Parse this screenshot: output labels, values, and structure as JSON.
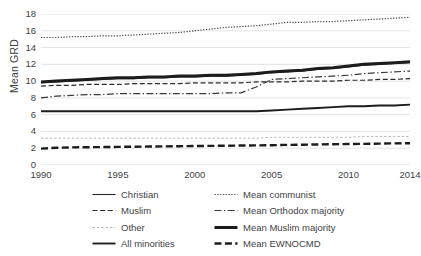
{
  "chart_data": {
    "type": "line",
    "title": "",
    "xlabel": "",
    "ylabel": "Mean GRD",
    "xlim": [
      1990,
      2014
    ],
    "ylim": [
      0,
      18
    ],
    "ytick_step": 2,
    "grid": "horizontal",
    "legend_position": "bottom",
    "xticks": [
      "1990",
      "1995",
      "2000",
      "2005",
      "2010",
      "2014"
    ],
    "yticks": [
      "0",
      "2",
      "4",
      "6",
      "8",
      "10",
      "12",
      "14",
      "16",
      "18"
    ],
    "x": [
      1990,
      1991,
      1992,
      1993,
      1994,
      1995,
      1996,
      1997,
      1998,
      1999,
      2000,
      2001,
      2002,
      2003,
      2004,
      2005,
      2006,
      2007,
      2008,
      2009,
      2010,
      2011,
      2012,
      2013,
      2014
    ],
    "series": [
      {
        "name": "Christian",
        "style": "solid-thin",
        "color": "#2b2b2b",
        "values": [
          9.8,
          9.9,
          10.0,
          10.1,
          10.2,
          10.3,
          10.3,
          10.4,
          10.4,
          10.5,
          10.5,
          10.6,
          10.6,
          10.7,
          10.8,
          11.0,
          11.1,
          11.2,
          11.4,
          11.5,
          11.7,
          11.9,
          12.0,
          12.1,
          12.2
        ]
      },
      {
        "name": "Muslim",
        "style": "dashed",
        "color": "#2b2b2b",
        "values": [
          9.4,
          9.5,
          9.5,
          9.6,
          9.6,
          9.6,
          9.7,
          9.7,
          9.7,
          9.7,
          9.8,
          9.8,
          9.8,
          9.8,
          9.9,
          9.9,
          9.9,
          10.0,
          10.0,
          10.0,
          10.1,
          10.1,
          10.2,
          10.2,
          10.3
        ]
      },
      {
        "name": "Other",
        "style": "dotted-light",
        "color": "#b9b9b9",
        "values": [
          3.2,
          3.2,
          3.2,
          3.2,
          3.2,
          3.2,
          3.2,
          3.2,
          3.2,
          3.2,
          3.2,
          3.2,
          3.2,
          3.2,
          3.2,
          3.3,
          3.3,
          3.3,
          3.3,
          3.3,
          3.3,
          3.4,
          3.4,
          3.4,
          3.4
        ]
      },
      {
        "name": "All minorities",
        "style": "solid-thick",
        "color": "#1c1c1c",
        "values": [
          6.4,
          6.4,
          6.4,
          6.4,
          6.4,
          6.4,
          6.4,
          6.4,
          6.4,
          6.4,
          6.4,
          6.4,
          6.4,
          6.4,
          6.4,
          6.5,
          6.6,
          6.7,
          6.8,
          6.9,
          7.0,
          7.0,
          7.1,
          7.1,
          7.2
        ]
      },
      {
        "name": "Mean communist",
        "style": "dotted",
        "color": "#4a4a4a",
        "values": [
          15.2,
          15.2,
          15.3,
          15.3,
          15.4,
          15.4,
          15.5,
          15.6,
          15.7,
          15.8,
          16.0,
          16.2,
          16.4,
          16.5,
          16.6,
          16.8,
          17.0,
          17.0,
          17.1,
          17.1,
          17.2,
          17.3,
          17.4,
          17.5,
          17.6
        ]
      },
      {
        "name": "Mean Orthodox majority",
        "style": "dash-dot",
        "color": "#3a3a3a",
        "values": [
          8.0,
          8.2,
          8.3,
          8.4,
          8.4,
          8.5,
          8.5,
          8.5,
          8.5,
          8.5,
          8.5,
          8.5,
          8.6,
          8.6,
          9.3,
          10.2,
          10.3,
          10.4,
          10.5,
          10.6,
          10.7,
          10.9,
          11.0,
          11.1,
          11.2
        ]
      },
      {
        "name": "Mean Muslim majority",
        "style": "solid-extrathick",
        "color": "#1c1c1c",
        "values": [
          9.9,
          10.0,
          10.1,
          10.2,
          10.3,
          10.4,
          10.4,
          10.5,
          10.5,
          10.6,
          10.6,
          10.7,
          10.7,
          10.8,
          10.9,
          11.1,
          11.2,
          11.3,
          11.5,
          11.6,
          11.8,
          12.0,
          12.1,
          12.2,
          12.3
        ]
      },
      {
        "name": "Mean EWNOCMD",
        "style": "dashed-bold",
        "color": "#1c1c1c",
        "values": [
          1.95,
          2.05,
          2.1,
          2.12,
          2.14,
          2.16,
          2.18,
          2.2,
          2.22,
          2.24,
          2.26,
          2.28,
          2.3,
          2.32,
          2.34,
          2.36,
          2.4,
          2.42,
          2.45,
          2.48,
          2.5,
          2.52,
          2.55,
          2.58,
          2.6
        ]
      }
    ]
  }
}
